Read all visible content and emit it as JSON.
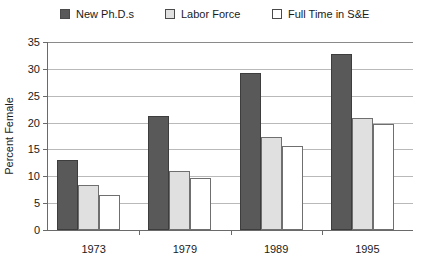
{
  "chart_data": {
    "type": "bar",
    "title": "",
    "xlabel": "",
    "ylabel": "Percent Female",
    "categories": [
      "1973",
      "1979",
      "1989",
      "1995"
    ],
    "series": [
      {
        "name": "New Ph.D.s",
        "color": "#595959",
        "values": [
          13.1,
          21.3,
          29.3,
          32.7
        ]
      },
      {
        "name": "Labor Force",
        "color": "#e0e0e0",
        "values": [
          8.4,
          10.9,
          17.3,
          20.8
        ]
      },
      {
        "name": "Full Time in S&E",
        "color": "#ffffff",
        "values": [
          6.5,
          9.6,
          15.7,
          19.8
        ]
      }
    ],
    "ylim": [
      0,
      35
    ],
    "yticks": [
      0,
      5,
      10,
      15,
      20,
      25,
      30,
      35
    ],
    "ytick_labels": [
      "0",
      "5",
      "10",
      "15",
      "20",
      "25",
      "30",
      "35"
    ],
    "grid": true,
    "legend_position": "top"
  }
}
